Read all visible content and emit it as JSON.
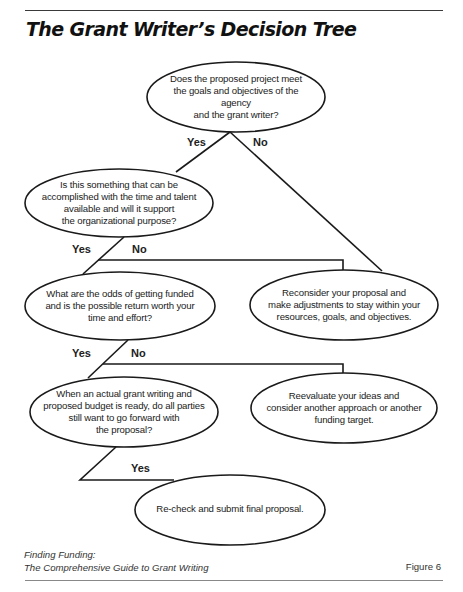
{
  "header": {
    "title": "The Grant Writer’s Decision Tree"
  },
  "tree": {
    "nodes": [
      {
        "id": "q1",
        "kind": "question",
        "text": "Does the proposed project meet\nthe goals and objectives of the agency\nand the grant writer?"
      },
      {
        "id": "q2",
        "kind": "question",
        "text": "Is this something that can be\naccomplished with the time and talent\navailable and will it support\nthe organizational purpose?"
      },
      {
        "id": "q3",
        "kind": "question",
        "text": "What are the odds of getting funded\nand is the possible return worth your\ntime and effort?"
      },
      {
        "id": "r1",
        "kind": "outcome",
        "text": "Reconsider your proposal and\nmake adjustments to stay within your\nresources, goals, and objectives."
      },
      {
        "id": "q4",
        "kind": "question",
        "text": "When an actual grant writing and\nproposed budget is ready, do all parties\nstill want to go forward with\nthe proposal?"
      },
      {
        "id": "r2",
        "kind": "outcome",
        "text": "Reevaluate your ideas and\nconsider another approach or another\nfunding target."
      },
      {
        "id": "r3",
        "kind": "outcome",
        "text": "Re-check and submit final proposal."
      }
    ],
    "branch_labels": {
      "q1_yes": "Yes",
      "q1_no": "No",
      "q2_yes": "Yes",
      "q2_no": "No",
      "q3_yes": "Yes",
      "q3_no": "No",
      "q4_yes": "Yes"
    },
    "edges": [
      {
        "from": "q1",
        "to": "q2",
        "label": "Yes"
      },
      {
        "from": "q1",
        "to": "r1",
        "label": "No"
      },
      {
        "from": "q2",
        "to": "q3",
        "label": "Yes"
      },
      {
        "from": "q2",
        "to": "r1",
        "label": "No"
      },
      {
        "from": "q3",
        "to": "q4",
        "label": "Yes"
      },
      {
        "from": "q3",
        "to": "r2",
        "label": "No"
      },
      {
        "from": "q4",
        "to": "r3",
        "label": "Yes"
      }
    ]
  },
  "footer": {
    "source_line1": "Finding Funding:",
    "source_line2": "The Comprehensive Guide to Grant Writing",
    "figure_label": "Figure 6"
  }
}
